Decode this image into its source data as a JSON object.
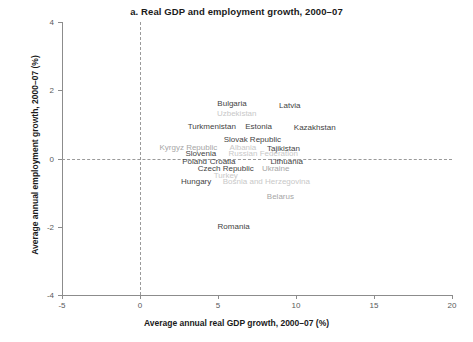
{
  "chart_data": {
    "type": "scatter",
    "title": "a. Real GDP and employment growth, 2000–07",
    "xlabel": "Average annual real GDP growth, 2000–07 (%)",
    "ylabel": "Average annual employment growth, 2000–07 (%)",
    "xlim": [
      -5,
      20
    ],
    "ylim": [
      -4,
      4
    ],
    "xticks": [
      "-5",
      "0",
      "5",
      "10",
      "15",
      "20"
    ],
    "xtick_values": [
      -5,
      0,
      5,
      10,
      15,
      20
    ],
    "yticks": [
      "4",
      "2",
      "0",
      "-2",
      "-4"
    ],
    "ytick_values": [
      4,
      2,
      0,
      -2,
      -4
    ],
    "grid": false,
    "legend": "none",
    "reference_lines": {
      "x": 0,
      "y": 0,
      "style": "dashed"
    },
    "points": [
      {
        "label": "Bulgaria",
        "x": 5.9,
        "y": 1.62,
        "shade": "dark"
      },
      {
        "label": "Latvia",
        "x": 9.6,
        "y": 1.58,
        "shade": "dark"
      },
      {
        "label": "Uzbekistan",
        "x": 6.2,
        "y": 1.33,
        "shade": "faint"
      },
      {
        "label": "Turkmenistan",
        "x": 4.6,
        "y": 0.96,
        "shade": "dark"
      },
      {
        "label": "Estonia",
        "x": 7.6,
        "y": 0.96,
        "shade": "dark"
      },
      {
        "label": "Kazakhstan",
        "x": 11.2,
        "y": 0.92,
        "shade": "dark"
      },
      {
        "label": "Slovak Republic",
        "x": 7.2,
        "y": 0.58,
        "shade": "dark"
      },
      {
        "label": "Kyrgyz Republic",
        "x": 3.1,
        "y": 0.33,
        "shade": "mid"
      },
      {
        "label": "Albania",
        "x": 6.6,
        "y": 0.33,
        "shade": "faint"
      },
      {
        "label": "Tajikistan",
        "x": 9.2,
        "y": 0.3,
        "shade": "dark"
      },
      {
        "label": "Slovenia",
        "x": 3.9,
        "y": 0.15,
        "shade": "dark"
      },
      {
        "label": "Russian Federation",
        "x": 7.9,
        "y": 0.15,
        "shade": "faint"
      },
      {
        "label": "Poland",
        "x": 3.5,
        "y": -0.06,
        "shade": "dark"
      },
      {
        "label": "Croatia",
        "x": 5.3,
        "y": -0.06,
        "shade": "dark"
      },
      {
        "label": "Lithuania",
        "x": 9.4,
        "y": -0.06,
        "shade": "dark"
      },
      {
        "label": "Czech Republic",
        "x": 5.5,
        "y": -0.28,
        "shade": "dark"
      },
      {
        "label": "Ukraine",
        "x": 8.7,
        "y": -0.28,
        "shade": "mid"
      },
      {
        "label": "Turkey",
        "x": 5.5,
        "y": -0.48,
        "shade": "faint"
      },
      {
        "label": "Hungary",
        "x": 3.6,
        "y": -0.66,
        "shade": "dark"
      },
      {
        "label": "Bosnia and Herzegovina",
        "x": 8.1,
        "y": -0.66,
        "shade": "faint"
      },
      {
        "label": "Belarus",
        "x": 9.0,
        "y": -1.09,
        "shade": "mid"
      },
      {
        "label": "Romania",
        "x": 6.0,
        "y": -1.99,
        "shade": "dark"
      }
    ]
  },
  "colors": {
    "axis": "#8c8c8c",
    "reference_line": "#9a9a9a",
    "text": "#231f20",
    "label_dark": "#3f3f3f",
    "label_mid": "#a6a6a6",
    "label_faint": "#c8c8c8",
    "background": "#ffffff"
  }
}
